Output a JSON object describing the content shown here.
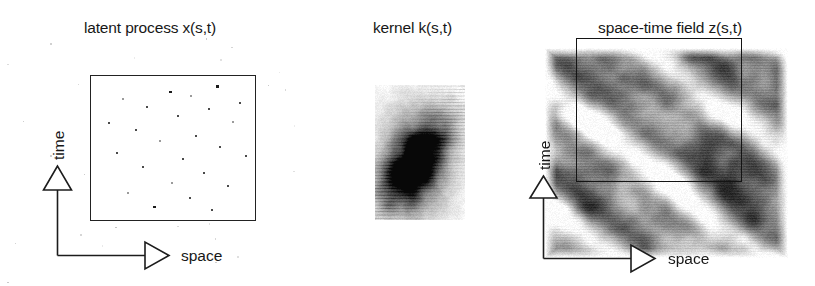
{
  "figure": {
    "kind": "scientific-diagram",
    "background_color": "#ffffff",
    "ink_color": "#1a1a1a"
  },
  "panels": [
    {
      "id": "latent",
      "title": "latent process x(s,t)",
      "axis_x_label": "space",
      "axis_y_label": "time",
      "content_type": "point-process",
      "box": {
        "x": 90,
        "y": 75,
        "width": 166,
        "height": 146
      }
    },
    {
      "id": "kernel",
      "title": "kernel k(s,t)",
      "axis_x_label": "",
      "axis_y_label": "",
      "content_type": "grayscale-kernel",
      "box": {
        "x": 375,
        "y": 85,
        "width": 90,
        "height": 135
      }
    },
    {
      "id": "field",
      "title": "space-time field z(s,t)",
      "axis_x_label": "space",
      "axis_y_label": "time",
      "content_type": "grayscale-field",
      "box": {
        "x": 576,
        "y": 78,
        "width": 166,
        "height": 144
      }
    }
  ],
  "chart_data": {
    "type": "scatter",
    "title": "latent process x(s,t)",
    "xlabel": "space",
    "ylabel": "time",
    "xlim": [
      0,
      1
    ],
    "ylim": [
      0,
      1
    ],
    "grid": false,
    "legend": "none",
    "points": [
      [
        0.47,
        0.91
      ],
      [
        0.76,
        0.95
      ],
      [
        0.18,
        0.86
      ],
      [
        0.6,
        0.88
      ],
      [
        0.9,
        0.83
      ],
      [
        0.33,
        0.8
      ],
      [
        0.71,
        0.79
      ],
      [
        0.52,
        0.74
      ],
      [
        0.09,
        0.69
      ],
      [
        0.86,
        0.7
      ],
      [
        0.26,
        0.64
      ],
      [
        0.63,
        0.6
      ],
      [
        0.41,
        0.56
      ],
      [
        0.78,
        0.52
      ],
      [
        0.14,
        0.48
      ],
      [
        0.55,
        0.44
      ],
      [
        0.94,
        0.46
      ],
      [
        0.3,
        0.38
      ],
      [
        0.68,
        0.34
      ],
      [
        0.48,
        0.27
      ],
      [
        0.83,
        0.25
      ],
      [
        0.21,
        0.2
      ],
      [
        0.59,
        0.16
      ],
      [
        0.37,
        0.1
      ],
      [
        0.73,
        0.08
      ]
    ]
  },
  "kernel_data": {
    "type": "heatmap",
    "title": "kernel k(s,t)",
    "colormap": "grayscale-inverted",
    "shape": "anisotropic sheared lobe, dark ridge tilted up-and-right",
    "peak": {
      "s": 0.45,
      "t": 0.42
    },
    "nx": 24,
    "ny": 34
  },
  "field_data": {
    "type": "heatmap",
    "title": "space-time field z(s,t)",
    "colormap": "grayscale-inverted",
    "structure": "diagonal travelling-wave bands running lower-left to upper-right",
    "nx": 40,
    "ny": 36
  }
}
